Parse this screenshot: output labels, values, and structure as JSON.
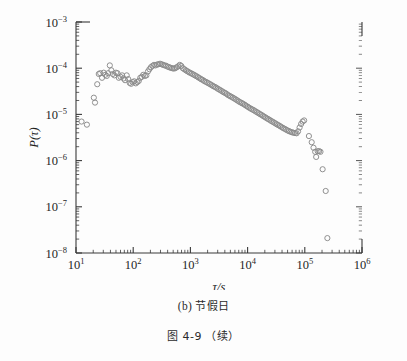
{
  "figure": {
    "subfigure_caption_prefix": "(b)",
    "subfigure_caption_text": "节假日",
    "figure_number": "图 4-9",
    "figure_note": "（续）",
    "background_color": "#fdfdfd",
    "axis_color": "#3a3a3a",
    "marker_color": "#8a8a8a"
  },
  "chart_data": {
    "type": "scatter",
    "title": "",
    "subtitle": "",
    "xlabel": "τ/s",
    "ylabel": "P(τ)",
    "xscale": "log",
    "yscale": "log",
    "xlim": [
      10,
      1000000
    ],
    "ylim": [
      1e-08,
      0.001
    ],
    "grid": false,
    "legend": null,
    "marker": "open-circle",
    "xticks": [
      10,
      100,
      1000,
      10000,
      100000,
      1000000
    ],
    "xtick_labels": [
      "10^1",
      "10^2",
      "10^3",
      "10^4",
      "10^5",
      "10^6"
    ],
    "yticks": [
      1e-08,
      1e-07,
      1e-06,
      1e-05,
      0.0001,
      0.001
    ],
    "ytick_labels": [
      "10^-8",
      "10^-7",
      "10^-6",
      "10^-5",
      "10^-4",
      "10^-3"
    ],
    "minor_ticks": true,
    "series": [
      {
        "name": "P(tau)",
        "x": [
          12.5,
          15.5,
          20.5,
          21.5,
          23.5,
          25.0,
          26.5,
          28.5,
          30.5,
          32.5,
          34.5,
          36.5,
          39.0,
          41.5,
          44.0,
          47.0,
          50.0,
          53.0,
          56.0,
          60.0,
          64.0,
          68.0,
          72.0,
          77.0,
          82.0,
          87.0,
          92.0,
          98.0,
          104.0,
          111.0,
          118.0,
          125.0,
          133.0,
          141.0,
          150.0,
          160.0,
          170.0,
          181.0,
          192.0,
          204.0,
          217.0,
          231.0,
          245.0,
          261.0,
          277.0,
          295.0,
          313.0,
          333.0,
          354.0,
          376.0,
          400.0,
          425.0,
          452.0,
          480.0,
          511.0,
          543.0,
          577.0,
          613.0,
          652.0,
          693.0,
          737.0,
          783.0,
          833.0,
          885.0,
          941.0,
          1000.0,
          1063.0,
          1130.0,
          1201.0,
          1277.0,
          1357.0,
          1443.0,
          1534.0,
          1631.0,
          1734.0,
          1843.0,
          1959.0,
          2083.0,
          2214.0,
          2354.0,
          2502.0,
          2660.0,
          2827.0,
          3005.0,
          3194.0,
          3395.0,
          3609.0,
          3836.0,
          4077.0,
          4334.0,
          4606.0,
          4896.0,
          5204.0,
          5532.0,
          5880.0,
          6250.0,
          6643.0,
          7061.0,
          7505.0,
          7978.0,
          8480.0,
          9013.0,
          9581.0,
          10184.0,
          10825.0,
          11506.0,
          12230.0,
          13000.0,
          13818.0,
          14688.0,
          15612.0,
          16594.0,
          17639.0,
          18749.0,
          19929.0,
          21183.0,
          22516.0,
          23933.0,
          25439.0,
          27040.0,
          28742.0,
          30551.0,
          32473.0,
          34517.0,
          36689.0,
          38998.0,
          41452.0,
          44060.0,
          46833.0,
          49780.0,
          52913.0,
          56242.0,
          59782.0,
          63544.0,
          67542.0,
          71793.0,
          76311.0,
          81113.0,
          86217.0,
          91642.0,
          97409.0,
          118000.0,
          132000.0,
          142000.0,
          152000.0,
          158000.0,
          168000.0,
          178000.0,
          188000.0,
          205000.0,
          232000.0,
          248000.0
        ],
        "y": [
          7e-06,
          6e-06,
          2.3e-05,
          1.8e-05,
          4.5e-05,
          7.5e-05,
          7.8e-05,
          6.2e-05,
          8e-05,
          7.2e-05,
          6.8e-05,
          7.8e-05,
          0.000115,
          9e-05,
          7.5e-05,
          7e-05,
          8e-05,
          7.8e-05,
          6.2e-05,
          6.5e-05,
          7e-05,
          6e-05,
          5.5e-05,
          7e-05,
          5.8e-05,
          4.8e-05,
          4.6e-05,
          5e-05,
          5.2e-05,
          4.7e-05,
          5e-05,
          5.3e-05,
          6.2e-05,
          6.5e-05,
          7.2e-05,
          6.8e-05,
          7e-05,
          8.5e-05,
          9.5e-05,
          0.000105,
          0.000112,
          0.000118,
          0.000115,
          0.00012,
          0.000122,
          0.000125,
          0.000122,
          0.000118,
          0.000115,
          0.000113,
          0.000108,
          0.000105,
          0.000102,
          0.0001,
          9.8e-05,
          0.0001,
          0.000105,
          0.00011,
          0.000118,
          0.000112,
          0.0001,
          9.5e-05,
          9e-05,
          8.6e-05,
          8.2e-05,
          7.9e-05,
          7.6e-05,
          7.3e-05,
          7e-05,
          6.7e-05,
          6.4e-05,
          6.1e-05,
          5.8e-05,
          5.6e-05,
          5.3e-05,
          5.1e-05,
          4.9e-05,
          4.7e-05,
          4.5e-05,
          4.3e-05,
          4.1e-05,
          3.95e-05,
          3.8e-05,
          3.6e-05,
          3.45e-05,
          3.3e-05,
          3.15e-05,
          3e-05,
          2.9e-05,
          2.75e-05,
          2.6e-05,
          2.5e-05,
          2.4e-05,
          2.3e-05,
          2.2e-05,
          2.1e-05,
          2e-05,
          1.9e-05,
          1.82e-05,
          1.75e-05,
          1.68e-05,
          1.6e-05,
          1.52e-05,
          1.45e-05,
          1.38e-05,
          1.32e-05,
          1.27e-05,
          1.22e-05,
          1.16e-05,
          1.11e-05,
          1.06e-05,
          1.01e-05,
          9.7e-06,
          9.2e-06,
          8.8e-06,
          8.4e-06,
          8e-06,
          7.7e-06,
          7.3e-06,
          7e-06,
          6.7e-06,
          6.4e-06,
          6.1e-06,
          5.85e-06,
          5.6e-06,
          5.35e-06,
          5.1e-06,
          4.9e-06,
          4.7e-06,
          4.5e-06,
          4.35e-06,
          4.2e-06,
          4.1e-06,
          4e-06,
          3.95e-06,
          3.9e-06,
          4.3e-06,
          5.2e-06,
          6.2e-06,
          7e-06,
          7.4e-06,
          3.4e-06,
          2.5e-06,
          1.9e-06,
          1.55e-06,
          1.2e-06,
          1.6e-06,
          1.6e-06,
          1.55e-06,
          6.5e-07,
          2.2e-07,
          2.1e-08
        ]
      }
    ]
  }
}
